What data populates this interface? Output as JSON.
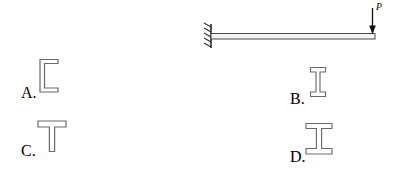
{
  "figure": {
    "type": "cantilever-beam-cross-section-question",
    "beam": {
      "support": "fixed",
      "support_hatch_count": 5,
      "load_label": "P",
      "load_direction": "down",
      "load_position": "free-end-right",
      "line_color": "#3a3a3a",
      "fill_color": "#f2f2f2"
    }
  },
  "options": [
    {
      "id": "A",
      "label": "A.",
      "shape": "channel-section",
      "shape_name": "C-channel cross section, opening to the right"
    },
    {
      "id": "B",
      "label": "B.",
      "shape": "i-beam-narrow-flange",
      "shape_name": "I-beam cross section with narrow flanges"
    },
    {
      "id": "C",
      "label": "C.",
      "shape": "tee-section",
      "shape_name": "T cross section with flange on top"
    },
    {
      "id": "D",
      "label": "D.",
      "shape": "i-beam-wide-flange",
      "shape_name": "I-beam cross section with wide flanges"
    }
  ],
  "colors": {
    "stroke": "#555555",
    "stroke_dark": "#2e2e2e",
    "background": "#ffffff",
    "section_fill": "#ffffff"
  }
}
